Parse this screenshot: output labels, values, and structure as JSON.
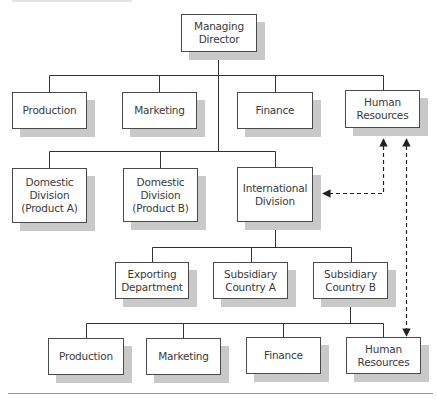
{
  "diagram": {
    "type": "organizational-chart",
    "nodes": [
      {
        "id": "md",
        "label": "Managing\nDirector",
        "x": 181,
        "y": 14,
        "w": 76,
        "h": 38
      },
      {
        "id": "prod1",
        "label": "Production",
        "x": 12,
        "y": 92,
        "w": 75,
        "h": 37
      },
      {
        "id": "mkt1",
        "label": "Marketing",
        "x": 122,
        "y": 92,
        "w": 75,
        "h": 37
      },
      {
        "id": "fin1",
        "label": "Finance",
        "x": 237,
        "y": 92,
        "w": 76,
        "h": 37
      },
      {
        "id": "hr1",
        "label": "Human\nResources",
        "x": 345,
        "y": 90,
        "w": 75,
        "h": 38
      },
      {
        "id": "domA",
        "label": "Domestic\nDivision\n(Product A)",
        "x": 12,
        "y": 168,
        "w": 75,
        "h": 55
      },
      {
        "id": "domB",
        "label": "Domestic\nDivision\n(Product B)",
        "x": 123,
        "y": 168,
        "w": 75,
        "h": 54
      },
      {
        "id": "intl",
        "label": "International\nDivision",
        "x": 237,
        "y": 167,
        "w": 76,
        "h": 55
      },
      {
        "id": "exp",
        "label": "Exporting\nDepartment",
        "x": 115,
        "y": 262,
        "w": 74,
        "h": 37
      },
      {
        "id": "subA",
        "label": "Subsidiary\nCountry A",
        "x": 213,
        "y": 262,
        "w": 75,
        "h": 37
      },
      {
        "id": "subB",
        "label": "Subsidiary\nCountry B",
        "x": 313,
        "y": 262,
        "w": 75,
        "h": 37
      },
      {
        "id": "prod2",
        "label": "Production",
        "x": 48,
        "y": 338,
        "w": 76,
        "h": 37
      },
      {
        "id": "mkt2",
        "label": "Marketing",
        "x": 146,
        "y": 338,
        "w": 75,
        "h": 37
      },
      {
        "id": "fin2",
        "label": "Finance",
        "x": 246,
        "y": 337,
        "w": 75,
        "h": 37
      },
      {
        "id": "hr2",
        "label": "Human\nResources",
        "x": 346,
        "y": 337,
        "w": 75,
        "h": 37
      }
    ],
    "edges": [
      {
        "from": "md",
        "to": "prod1",
        "style": "solid"
      },
      {
        "from": "md",
        "to": "mkt1",
        "style": "solid"
      },
      {
        "from": "md",
        "to": "fin1",
        "style": "solid"
      },
      {
        "from": "md",
        "to": "hr1",
        "style": "solid"
      },
      {
        "from": "md",
        "to": "domA",
        "style": "solid"
      },
      {
        "from": "md",
        "to": "domB",
        "style": "solid"
      },
      {
        "from": "md",
        "to": "intl",
        "style": "solid"
      },
      {
        "from": "intl",
        "to": "exp",
        "style": "solid"
      },
      {
        "from": "intl",
        "to": "subA",
        "style": "solid"
      },
      {
        "from": "intl",
        "to": "subB",
        "style": "solid"
      },
      {
        "from": "subB",
        "to": "prod2",
        "style": "solid"
      },
      {
        "from": "subB",
        "to": "mkt2",
        "style": "solid"
      },
      {
        "from": "subB",
        "to": "fin2",
        "style": "solid"
      },
      {
        "from": "subB",
        "to": "hr2",
        "style": "solid"
      },
      {
        "from": "hr1",
        "to": "intl",
        "style": "dashed",
        "bidirectional": true
      },
      {
        "from": "hr1",
        "to": "hr2",
        "style": "dashed",
        "bidirectional": true
      }
    ],
    "colors": {
      "box_border": "#4a4a4a",
      "box_fill": "#ffffff",
      "shadow": "#c9c9c9",
      "line": "#333333",
      "text": "#3a3a3a"
    }
  }
}
